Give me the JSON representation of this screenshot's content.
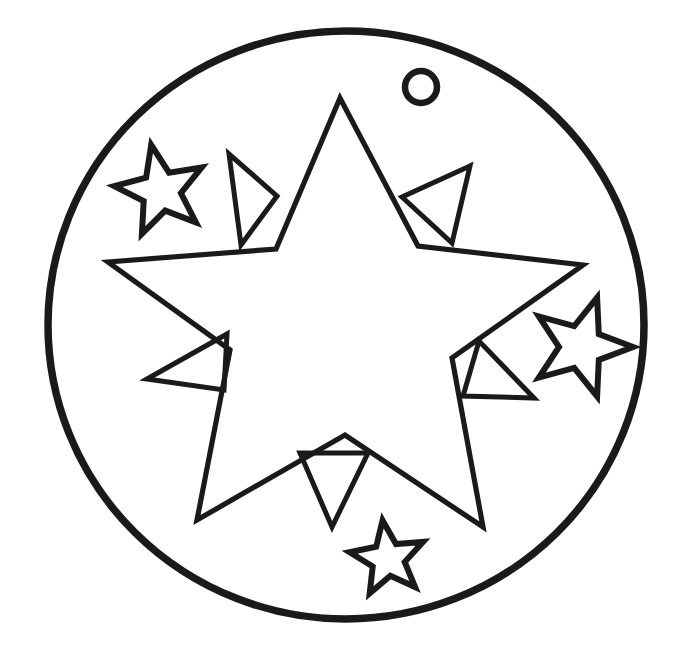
{
  "page": {
    "background_color": "#ffffff",
    "ink_color": "#1a1a1a",
    "width": 681,
    "height": 649,
    "style": "black-and-white line art / coloring page outline"
  },
  "artwork": {
    "name": "star-medallion",
    "description": "A large circular medallion outline containing a five-pointed star with small triangular spikes in its notches, three small five-pointed stars, and a small punched hole near the top right.",
    "stroke_color": "#1a1a1a",
    "fill_color": "#ffffff"
  },
  "shapes": {
    "outer_circle": {
      "name": "outer-circle",
      "cx": 346,
      "cy": 325,
      "rx": 298,
      "ry": 294,
      "stroke_width": 7.5
    },
    "hanging_hole": {
      "name": "hanging-hole",
      "cx": 421,
      "cy": 87,
      "r": 16,
      "stroke_width": 6.5
    },
    "main_star": {
      "name": "main-star",
      "points": "340,98 276,249 108,262 230,350 197,520 345,435 483,527 452,358 583,265 418,246",
      "stroke_width": 5.2,
      "point_count": 5
    },
    "spikes": [
      {
        "name": "spike-top-left",
        "points": "229,154 241,245 277,196",
        "stroke_width": 5.0
      },
      {
        "name": "spike-top-right",
        "points": "470,166 402,197 452,243",
        "stroke_width": 5.0
      },
      {
        "name": "spike-left",
        "points": "147,379 227,334 224,390",
        "stroke_width": 5.0
      },
      {
        "name": "spike-right",
        "points": "534,398 479,341 463,396",
        "stroke_width": 5.0
      },
      {
        "name": "spike-bottom",
        "points": "332,527 300,453 368,453",
        "stroke_width": 5.0
      }
    ],
    "mini_stars": [
      {
        "name": "mini-star-upper-left",
        "cx": 161,
        "cy": 191,
        "outer_r": 47,
        "inner_r": 20,
        "rotation_deg": -12,
        "stroke_width": 6.0
      },
      {
        "name": "mini-star-right",
        "cx": 581,
        "cy": 347,
        "outer_r": 52,
        "inner_r": 22,
        "rotation_deg": 18,
        "stroke_width": 6.0
      },
      {
        "name": "mini-star-bottom",
        "cx": 388,
        "cy": 559,
        "outer_r": 39,
        "inner_r": 17,
        "rotation_deg": -8,
        "stroke_width": 6.0
      }
    ]
  }
}
